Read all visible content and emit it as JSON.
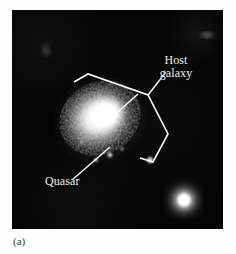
{
  "figure": {
    "caption": "(a)",
    "plate": {
      "background_color": "#050505",
      "width": 211,
      "height": 219
    },
    "annotations": {
      "host_galaxy_label": "Host\ngalaxy",
      "host_galaxy_label_line1": "Host",
      "host_galaxy_label_line2": "galaxy",
      "quasar_label": "Quasar",
      "annotation_color": "#f2f2f2"
    },
    "objects": [
      {
        "name": "host-galaxy",
        "type": "spiral-galaxy",
        "description": "bright mottled elliptical host galaxy with overexposed core"
      },
      {
        "name": "quasar",
        "type": "point-source",
        "description": "unresolved bright nucleus at galaxy center"
      },
      {
        "name": "companion-star",
        "type": "point-source",
        "description": "bright round object at lower right of the plate"
      },
      {
        "name": "knot-source",
        "type": "point-source",
        "description": "small bright knot at lower right inside the bracket"
      }
    ]
  }
}
